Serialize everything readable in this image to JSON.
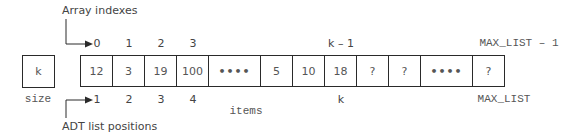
{
  "labels": {
    "array_indexes": "Array indexes",
    "adt_list_positions": "ADT list positions",
    "size": "size",
    "items": "items"
  },
  "size_value": "k",
  "cells": [
    {
      "value": "12",
      "index": "0",
      "position": "1"
    },
    {
      "value": "3",
      "index": "1",
      "position": "2"
    },
    {
      "value": "19",
      "index": "2",
      "position": "3"
    },
    {
      "value": "100",
      "index": "3",
      "position": "4"
    },
    {
      "value": "••••",
      "index": "",
      "position": ""
    },
    {
      "value": "5",
      "index": "",
      "position": ""
    },
    {
      "value": "10",
      "index": "",
      "position": ""
    },
    {
      "value": "18",
      "index": "k – 1",
      "position": "k"
    },
    {
      "value": "?",
      "index": "",
      "position": ""
    },
    {
      "value": "?",
      "index": "",
      "position": ""
    },
    {
      "value": "••••",
      "index": "",
      "position": ""
    },
    {
      "value": "?",
      "index": "MAX_LIST – 1",
      "position": "MAX_LIST"
    }
  ],
  "colors": {
    "line": "#2a2a2a",
    "text": "#555555"
  }
}
